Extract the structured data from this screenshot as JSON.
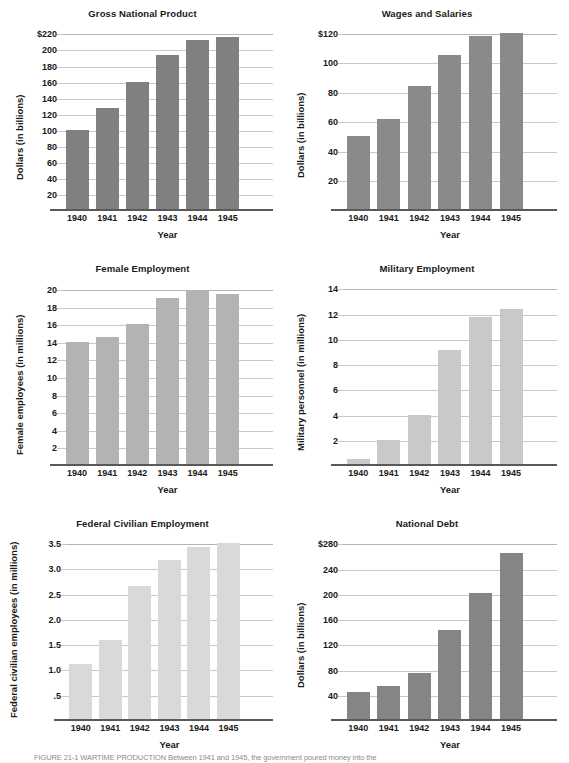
{
  "figure": {
    "caption": "FIGURE 21-1  WARTIME PRODUCTION Between 1941 and 1945, the government poured money into the"
  },
  "chart_data": [
    {
      "type": "bar",
      "title": "Gross National Product",
      "xlabel": "Year",
      "ylabel": "Dollars (in billions)",
      "categories": [
        "1940",
        "1941",
        "1942",
        "1943",
        "1944",
        "1945"
      ],
      "values": [
        100,
        127,
        159,
        193,
        212,
        215
      ],
      "yticks": [
        20,
        40,
        60,
        80,
        100,
        120,
        140,
        160,
        180,
        200,
        220
      ],
      "ytick_labels": [
        "20",
        "40",
        "60",
        "80",
        "100",
        "120",
        "140",
        "160",
        "180",
        "200",
        "$220"
      ],
      "ylim": [
        0,
        228
      ],
      "grid": true,
      "bar_color": "#808080"
    },
    {
      "type": "bar",
      "title": "Wages and Salaries",
      "xlabel": "Year",
      "ylabel": "Dollars (in billions)",
      "categories": [
        "1940",
        "1941",
        "1942",
        "1943",
        "1944",
        "1945"
      ],
      "values": [
        50,
        62,
        84,
        105,
        118,
        120
      ],
      "yticks": [
        20,
        40,
        60,
        80,
        100,
        120
      ],
      "ytick_labels": [
        "20",
        "40",
        "60",
        "80",
        "100",
        "$120"
      ],
      "ylim": [
        0,
        124
      ],
      "grid": true,
      "bar_color": "#8a8a8a"
    },
    {
      "type": "bar",
      "title": "Female Employment",
      "xlabel": "Year",
      "ylabel": "Female employees (in millions)",
      "categories": [
        "1940",
        "1941",
        "1942",
        "1943",
        "1944",
        "1945"
      ],
      "values": [
        14.0,
        14.5,
        16.0,
        19.0,
        19.8,
        19.4
      ],
      "yticks": [
        2,
        4,
        6,
        8,
        10,
        12,
        14,
        16,
        18,
        20
      ],
      "ytick_labels": [
        "2",
        "4",
        "6",
        "8",
        "10",
        "12",
        "14",
        "16",
        "18",
        "20"
      ],
      "ylim": [
        0,
        20.8
      ],
      "grid": true,
      "bar_color": "#b3b3b3"
    },
    {
      "type": "bar",
      "title": "Military Employment",
      "xlabel": "Year",
      "ylabel": "Military personnel (in millions)",
      "categories": [
        "1940",
        "1941",
        "1942",
        "1943",
        "1944",
        "1945"
      ],
      "values": [
        0.5,
        2.0,
        4.0,
        9.1,
        11.7,
        12.4
      ],
      "yticks": [
        2,
        4,
        6,
        8,
        10,
        12,
        14
      ],
      "ytick_labels": [
        "2",
        "4",
        "6",
        "8",
        "10",
        "12",
        "14"
      ],
      "ylim": [
        0,
        14.5
      ],
      "grid": true,
      "bar_color": "#c9c9c9"
    },
    {
      "type": "bar",
      "title": "Federal Civilian Employment",
      "xlabel": "Year",
      "ylabel": "Federal civilian employees (in millions)",
      "categories": [
        "1940",
        "1941",
        "1942",
        "1943",
        "1944",
        "1945"
      ],
      "values": [
        1.1,
        1.58,
        2.66,
        3.17,
        3.42,
        3.5
      ],
      "yticks": [
        0.5,
        1.0,
        1.5,
        2.0,
        2.5,
        3.0,
        3.5
      ],
      "ytick_labels": [
        ".5",
        "1.0",
        "1.5",
        "2.0",
        "2.5",
        "3.0",
        "3.5"
      ],
      "ylim": [
        0,
        3.62
      ],
      "grid": true,
      "bar_color": "#d9d9d9"
    },
    {
      "type": "bar",
      "title": "National Debt",
      "xlabel": "Year",
      "ylabel": "Dollars (in billions)",
      "categories": [
        "1940",
        "1941",
        "1942",
        "1943",
        "1944",
        "1945"
      ],
      "values": [
        45,
        54,
        75,
        143,
        202,
        264
      ],
      "yticks": [
        40,
        80,
        120,
        160,
        200,
        240,
        280
      ],
      "ytick_labels": [
        "40",
        "80",
        "120",
        "160",
        "200",
        "240",
        "$280"
      ],
      "ylim": [
        0,
        290
      ],
      "grid": true,
      "bar_color": "#858585"
    }
  ]
}
